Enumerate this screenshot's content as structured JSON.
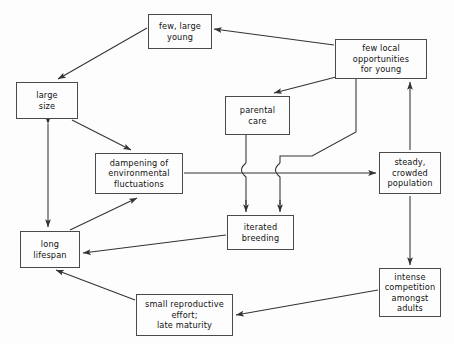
{
  "diagram": {
    "type": "flow-diagram",
    "background_color": "#fdfdfd",
    "line_color": "#333333",
    "box_border_color": "#4a4a4a",
    "text_color": "#111111",
    "nodes": [
      {
        "id": "few_large_young",
        "label": "few, large\nyoung",
        "x": 148,
        "y": 14,
        "w": 64,
        "h": 35
      },
      {
        "id": "few_local_opps",
        "label": "few local\nopportunities\nfor young",
        "x": 335,
        "y": 39,
        "w": 92,
        "h": 40
      },
      {
        "id": "large_size",
        "label": "large\nsize",
        "x": 16,
        "y": 82,
        "w": 62,
        "h": 37
      },
      {
        "id": "parental_care",
        "label": "parental\ncare",
        "x": 225,
        "y": 96,
        "w": 65,
        "h": 39
      },
      {
        "id": "dampening",
        "label": "dampening of\nenvironmental\nfluctuations",
        "x": 95,
        "y": 153,
        "w": 88,
        "h": 41
      },
      {
        "id": "steady_crowded",
        "label": "steady,\ncrowded\npopulation",
        "x": 379,
        "y": 152,
        "w": 62,
        "h": 42
      },
      {
        "id": "iterated_breeding",
        "label": "iterated\nbreeding",
        "x": 227,
        "y": 215,
        "w": 67,
        "h": 35
      },
      {
        "id": "long_lifespan",
        "label": "long\nlifespan",
        "x": 20,
        "y": 231,
        "w": 60,
        "h": 37
      },
      {
        "id": "intense_comp",
        "label": "intense\ncompetition\namongst\nadults",
        "x": 379,
        "y": 268,
        "w": 62,
        "h": 49
      },
      {
        "id": "small_repro",
        "label": "small reproductive\neffort;\nlate maturity",
        "x": 136,
        "y": 294,
        "w": 97,
        "h": 42
      }
    ],
    "edges": [
      {
        "id": "e1",
        "from": "few_large_young",
        "to": "large_size",
        "arrow": "single",
        "description": "few large young to large size"
      },
      {
        "id": "e2",
        "from": "few_local_opps",
        "to": "few_large_young",
        "arrow": "single",
        "description": "few local opportunities to few large young"
      },
      {
        "id": "e3",
        "from": "few_local_opps",
        "to": "parental_care",
        "arrow": "single",
        "description": "few local opportunities to parental care"
      },
      {
        "id": "e4",
        "from": "few_local_opps",
        "to": "iterated_breeding",
        "arrow": "single",
        "description": "few local opportunities routed down to iterated breeding"
      },
      {
        "id": "e5",
        "from": "large_size",
        "to": "dampening",
        "arrow": "single",
        "description": "large size to dampening"
      },
      {
        "id": "e6",
        "from": "large_size",
        "to": "long_lifespan",
        "arrow": "double",
        "description": "large size and long lifespan mutual"
      },
      {
        "id": "e7",
        "from": "parental_care",
        "to": "iterated_breeding",
        "arrow": "single",
        "description": "parental care down to iterated breeding with wire hop"
      },
      {
        "id": "e8",
        "from": "dampening",
        "to": "steady_crowded",
        "arrow": "single",
        "description": "dampening to steady crowded population"
      },
      {
        "id": "e9",
        "from": "long_lifespan",
        "to": "dampening",
        "arrow": "single",
        "description": "long lifespan to dampening"
      },
      {
        "id": "e10",
        "from": "iterated_breeding",
        "to": "long_lifespan",
        "arrow": "single",
        "description": "iterated breeding to long lifespan"
      },
      {
        "id": "e11",
        "from": "steady_crowded",
        "to": "few_local_opps",
        "arrow": "single",
        "description": "steady crowded population up to few local opportunities"
      },
      {
        "id": "e12",
        "from": "steady_crowded",
        "to": "intense_comp",
        "arrow": "single",
        "description": "steady crowded population down to intense competition"
      },
      {
        "id": "e13",
        "from": "intense_comp",
        "to": "small_repro",
        "arrow": "single",
        "description": "intense competition to small reproductive effort"
      },
      {
        "id": "e14",
        "from": "small_repro",
        "to": "long_lifespan",
        "arrow": "single",
        "description": "small reproductive effort to long lifespan"
      }
    ]
  }
}
